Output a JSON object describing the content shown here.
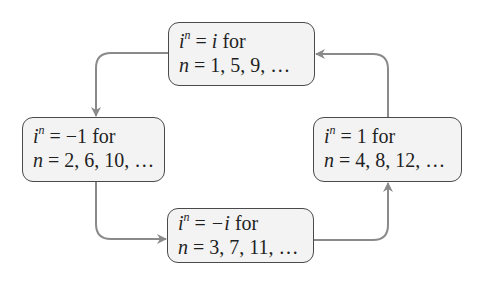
{
  "diagram": {
    "nodes": [
      {
        "id": "top",
        "line1_lhs": "i",
        "line1_exp": "n",
        "line1_eq": " = ",
        "line1_rhs": "i",
        "line1_for": " for",
        "line2_var": "n",
        "line2_eq": " = ",
        "line2_vals": "1, 5, 9, …"
      },
      {
        "id": "left",
        "line1_lhs": "i",
        "line1_exp": "n",
        "line1_eq": " = ",
        "line1_rhs": "−1",
        "line1_for": " for",
        "line2_var": "n",
        "line2_eq": " = ",
        "line2_vals": "2, 6, 10, …"
      },
      {
        "id": "bottom",
        "line1_lhs": "i",
        "line1_exp": "n",
        "line1_eq": " = ",
        "line1_rhs": "−i",
        "line1_for": " for",
        "line2_var": "n",
        "line2_eq": " = ",
        "line2_vals": "3, 7, 11, …"
      },
      {
        "id": "right",
        "line1_lhs": "i",
        "line1_exp": "n",
        "line1_eq": " = ",
        "line1_rhs": "1",
        "line1_for": " for",
        "line2_var": "n",
        "line2_eq": " = ",
        "line2_vals": "4, 8, 12, …"
      }
    ],
    "edges": [
      {
        "from": "top",
        "to": "left"
      },
      {
        "from": "left",
        "to": "bottom"
      },
      {
        "from": "bottom",
        "to": "right"
      },
      {
        "from": "right",
        "to": "top"
      }
    ],
    "colors": {
      "box_fill": "#f3f3f3",
      "box_border": "#4a4a4a",
      "arrow": "#8a8a8a",
      "text": "#1f1f1f"
    }
  }
}
